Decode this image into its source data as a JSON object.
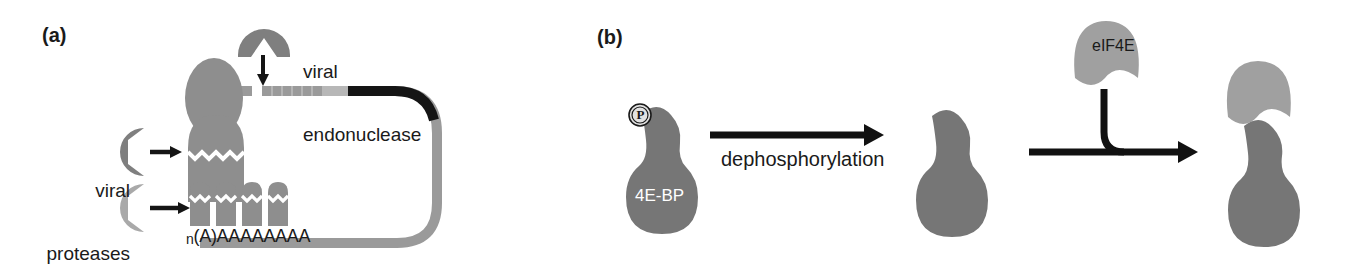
{
  "figure": {
    "background_color": "#ffffff",
    "width": 1362,
    "height": 262
  },
  "palette": {
    "dark_gray": "#7f7f7f",
    "mid_gray": "#8e8e8e",
    "light_gray": "#a9a9a9",
    "rna_gray": "#9a9a9a",
    "rna_light_gray": "#b5b5b5",
    "rna_black": "#111111",
    "protein_dark": "#767676",
    "protein_light": "#9f9f9f",
    "text_black": "#1a1a1a",
    "text_white": "#ffffff"
  },
  "panel_a": {
    "label": "(a)",
    "labels": {
      "viral_endonuclease_line1": "viral",
      "viral_endonuclease_line2": "endonuclease",
      "viral_proteases_line1": "viral",
      "viral_proteases_line2": "proteases",
      "polya_subscript": "n",
      "polya_text": "(A)AAAAAAAA"
    },
    "elements": {
      "endonuclease": "pacman-shape-dark-gray",
      "endonuclease_arrow": "down-arrow",
      "protease_upper": "pacman-shape-dark-gray",
      "protease_lower": "pacman-shape-light-gray",
      "protease_upper_arrow": "right-arrow",
      "protease_lower_arrow": "right-arrow",
      "cap_binding_protein": "gray-oval",
      "cleaved_factor": "gray-capsule-with-zigzag-cut",
      "pabp_units": "four-gray-capsules-with-zigzag-cut",
      "mrna_strand": "looped-closed-mrna"
    }
  },
  "panel_b": {
    "label": "(b)",
    "labels": {
      "phospho_badge": "P",
      "protein_4ebp": "4E-BP",
      "step1_arrow_label": "dephosphorylation",
      "eif4e": "eIF4E"
    },
    "elements": {
      "state1": "phosphorylated-4E-BP",
      "arrow1": "right-arrow",
      "state2": "dephosphorylated-4E-BP",
      "arrow2": "right-arrow-with-incoming-branch",
      "incoming_factor": "eIF4E-dome",
      "state3": "4E-BP-eIF4E-complex"
    }
  }
}
